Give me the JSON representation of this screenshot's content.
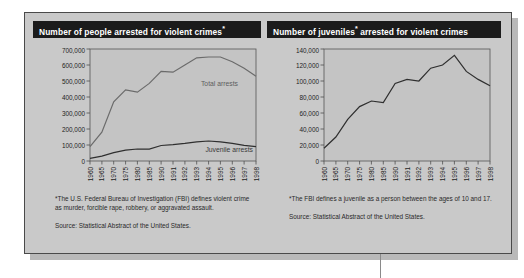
{
  "figure": {
    "background_color": "#c9c9c9",
    "border_color": "#4a4a4a",
    "title_bar_color": "#1b1b1b"
  },
  "panels": [
    {
      "id": "violent-crime-arrests-total",
      "title_main": "Number of people arrested for violent crimes",
      "title_sup": "*",
      "footnote": "*The U.S. Federal Bureau of Investigation (FBI) defines violent crime as murder, forcible rape, robbery, or aggravated assault.",
      "source": "Source: Statistical Abstract of the United States."
    },
    {
      "id": "violent-crime-arrests-juvenile",
      "title_pre": "Number of juveniles",
      "title_sup": "*",
      "title_post": " arrested for violent crimes",
      "footnote": "*The FBI defines a juvenile as a person between the ages of 10 and 17.",
      "source": "Source: Statistical Abstract of the United States."
    }
  ],
  "chart_data": [
    {
      "type": "line",
      "id": "violent-crime-arrests-total",
      "title": "Number of people arrested for violent crimes*",
      "xlabel": "",
      "ylabel": "",
      "grid": false,
      "legend": "inline-series-labels",
      "ylim": [
        0,
        700000
      ],
      "yticks": [
        0,
        100000,
        200000,
        300000,
        400000,
        500000,
        600000,
        700000
      ],
      "ytick_labels": [
        "0",
        "100,000",
        "200,000",
        "300,000",
        "400,000",
        "500,000",
        "600,000",
        "700,000"
      ],
      "x": [
        "1960",
        "1965",
        "1970",
        "1975",
        "1980",
        "1985",
        "1990",
        "1991",
        "1992",
        "1993",
        "1994",
        "1995",
        "1996",
        "1997",
        "1998"
      ],
      "series": [
        {
          "name": "Total arrests",
          "color": "#6b6b6b",
          "values": [
            90000,
            180000,
            370000,
            445000,
            430000,
            485000,
            560000,
            555000,
            600000,
            645000,
            650000,
            650000,
            620000,
            580000,
            530000
          ]
        },
        {
          "name": "Juvenile arrests",
          "color": "#2f2f2f",
          "values": [
            16000,
            30000,
            52000,
            68000,
            75000,
            74000,
            97000,
            102000,
            110000,
            120000,
            125000,
            120000,
            110000,
            98000,
            90000
          ]
        }
      ]
    },
    {
      "type": "line",
      "id": "violent-crime-arrests-juvenile",
      "title": "Number of juveniles* arrested for violent crimes",
      "xlabel": "",
      "ylabel": "",
      "grid": false,
      "legend": "none",
      "ylim": [
        0,
        140000
      ],
      "yticks": [
        0,
        20000,
        40000,
        60000,
        80000,
        100000,
        120000,
        140000
      ],
      "ytick_labels": [
        "0",
        "20,000",
        "40,000",
        "60,000",
        "80,000",
        "100,000",
        "120,000",
        "140,000"
      ],
      "x": [
        "1960",
        "1965",
        "1970",
        "1975",
        "1980",
        "1985",
        "1990",
        "1991",
        "1992",
        "1993",
        "1994",
        "1995",
        "1996",
        "1997",
        "1998"
      ],
      "series": [
        {
          "name": "Juvenile arrests",
          "color": "#2f2f2f",
          "values": [
            16000,
            30000,
            52000,
            68000,
            75000,
            73000,
            97000,
            102000,
            100000,
            116000,
            120000,
            132000,
            112000,
            102000,
            94000
          ]
        }
      ]
    }
  ]
}
